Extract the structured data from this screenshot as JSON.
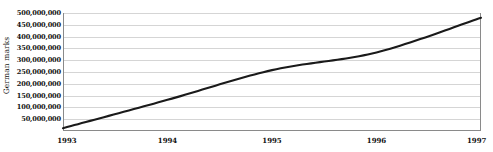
{
  "chart_data": {
    "type": "line",
    "title": "",
    "xlabel": "",
    "ylabel": "German marks",
    "x": [
      1993,
      1994,
      1995,
      1996,
      1997
    ],
    "categories": [
      "1993",
      "1994",
      "1995",
      "1996",
      "1997"
    ],
    "values": [
      12000000,
      132000000,
      258000000,
      333000000,
      480000000
    ],
    "series": [
      {
        "name": "German marks",
        "values": [
          12000000,
          132000000,
          258000000,
          333000000,
          480000000
        ]
      }
    ],
    "xlim": [
      1993,
      1997
    ],
    "ylim": [
      0,
      500000000
    ],
    "grid": true,
    "legend": false,
    "legend_position": "none",
    "line_color": "#1a1a1a",
    "grid_color": "#d5d5d5",
    "axis_color": "#8a8a8a",
    "background_color": "#ffffff",
    "y_ticks": [
      50000000,
      100000000,
      150000000,
      200000000,
      250000000,
      300000000,
      350000000,
      400000000,
      450000000,
      500000000
    ],
    "y_tick_labels": [
      "50,000,000",
      "100,000,000",
      "150,000,000",
      "200,000,000",
      "250,000,000",
      "300,000,000",
      "350,000,000",
      "400,000,000",
      "450,000,000",
      "500,000,000"
    ],
    "x_tick_labels": [
      "1993",
      "1994",
      "1995",
      "1996",
      "1997"
    ]
  }
}
